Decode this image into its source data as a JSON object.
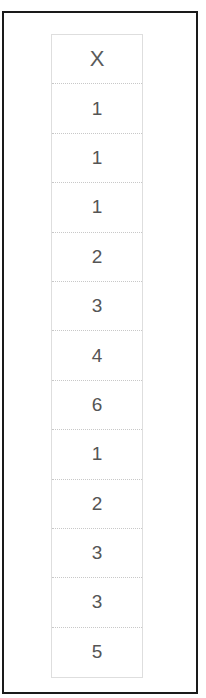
{
  "table": {
    "header": "X",
    "values": [
      "1",
      "1",
      "1",
      "2",
      "3",
      "4",
      "6",
      "1",
      "2",
      "3",
      "3",
      "5"
    ]
  }
}
